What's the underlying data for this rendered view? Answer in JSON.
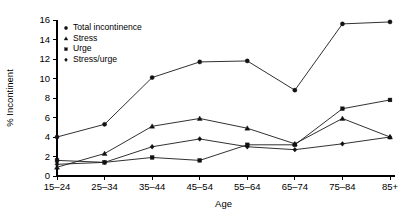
{
  "chart_data": {
    "type": "line",
    "title": "",
    "xlabel": "Age",
    "ylabel": "% Incontinent",
    "categories": [
      "15–24",
      "25–34",
      "35–44",
      "45–54",
      "55–64",
      "65–74",
      "75–84",
      "85+"
    ],
    "ylim": [
      0,
      16
    ],
    "yticks": [
      0,
      2,
      4,
      6,
      8,
      10,
      12,
      14,
      16
    ],
    "ytick_labels": [
      "0",
      "2",
      "4",
      "6",
      "8",
      "10",
      "12",
      "14",
      "16"
    ],
    "grid": false,
    "legend_position": "top-left",
    "series": [
      {
        "name": "Total incontinence",
        "marker": "circle",
        "values": [
          4.0,
          5.3,
          10.1,
          11.7,
          11.8,
          8.8,
          15.6,
          15.8
        ]
      },
      {
        "name": "Stress",
        "marker": "triangle",
        "values": [
          0.9,
          2.3,
          5.1,
          5.9,
          4.9,
          3.3,
          5.9,
          4.0
        ]
      },
      {
        "name": "Urge",
        "marker": "square",
        "values": [
          1.6,
          1.4,
          1.9,
          1.6,
          3.2,
          3.2,
          6.9,
          7.8
        ]
      },
      {
        "name": "Stress/urge",
        "marker": "diamond",
        "values": [
          1.2,
          1.4,
          3.0,
          3.8,
          3.0,
          2.7,
          3.3,
          4.0
        ]
      }
    ]
  },
  "legend": {
    "items": [
      {
        "label": "Total incontinence",
        "marker": "circle"
      },
      {
        "label": "Stress",
        "marker": "triangle"
      },
      {
        "label": "Urge",
        "marker": "square"
      },
      {
        "label": "Stress/urge",
        "marker": "diamond"
      }
    ]
  },
  "axes": {
    "x_title": "Age",
    "y_title": "% Incontinent"
  }
}
